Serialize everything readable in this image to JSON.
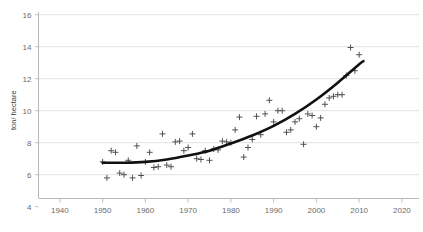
{
  "chart_data": {
    "type": "scatter",
    "title": "",
    "xlabel": "",
    "ylabel": "ton/ hectare",
    "xlim": [
      1935,
      2024
    ],
    "ylim": [
      4,
      16
    ],
    "xticks": [
      1940,
      1950,
      1960,
      1970,
      1980,
      1990,
      2000,
      2010,
      2020
    ],
    "yticks": [
      4,
      6,
      8,
      10,
      12,
      14,
      16
    ],
    "grid": "horizontal",
    "legend": "none",
    "marker_style": "plus",
    "colors": {
      "marker": "#4a4a4a",
      "trend": "#111111",
      "gridline": "#d9d9d9",
      "axis": "#b0b0b0",
      "tick_label": "#6b6b6b",
      "background": "#ffffff"
    },
    "x": [
      1950,
      1951,
      1952,
      1953,
      1954,
      1955,
      1956,
      1957,
      1958,
      1959,
      1960,
      1961,
      1962,
      1963,
      1964,
      1965,
      1966,
      1967,
      1968,
      1969,
      1970,
      1971,
      1972,
      1973,
      1974,
      1975,
      1976,
      1977,
      1978,
      1979,
      1980,
      1981,
      1982,
      1983,
      1984,
      1985,
      1986,
      1987,
      1988,
      1989,
      1990,
      1991,
      1992,
      1993,
      1994,
      1995,
      1996,
      1997,
      1998,
      1999,
      2000,
      2001,
      2002,
      2003,
      2004,
      2005,
      2006,
      2007,
      2008,
      2009,
      2010
    ],
    "values": [
      6.8,
      5.8,
      7.5,
      7.4,
      6.1,
      6.0,
      6.9,
      5.8,
      7.8,
      5.95,
      6.8,
      7.4,
      6.45,
      6.5,
      8.55,
      6.6,
      6.5,
      8.05,
      8.1,
      7.5,
      7.7,
      8.55,
      7.0,
      6.95,
      7.5,
      6.9,
      7.6,
      7.55,
      8.1,
      8.05,
      8.0,
      8.8,
      9.6,
      7.1,
      7.7,
      8.2,
      9.65,
      8.5,
      9.8,
      10.65,
      9.3,
      10.0,
      10.0,
      8.65,
      8.8,
      9.3,
      9.5,
      7.9,
      9.8,
      9.7,
      9.0,
      9.55,
      10.4,
      10.8,
      10.9,
      11.0,
      11.0,
      12.2,
      13.95,
      12.5,
      13.5
    ],
    "trend": {
      "label": "fitted trend curve",
      "x": [
        1950,
        1955,
        1960,
        1965,
        1970,
        1975,
        1980,
        1985,
        1990,
        1995,
        2000,
        2005,
        2010,
        2011
      ],
      "y": [
        6.75,
        6.75,
        6.8,
        6.95,
        7.2,
        7.5,
        7.95,
        8.45,
        9.05,
        9.8,
        10.7,
        11.75,
        12.9,
        13.1
      ]
    }
  },
  "axis": {
    "y_title": "ton/ hectare"
  }
}
